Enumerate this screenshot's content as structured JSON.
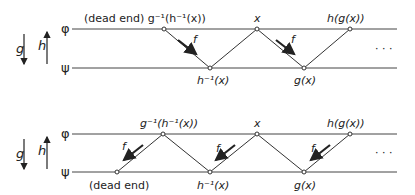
{
  "sets": {
    "top": "φ",
    "bottom": "ψ"
  },
  "maps": {
    "down": "g",
    "up": "h",
    "edge": "f"
  },
  "ellipsis": "· · ·",
  "diagrams": [
    {
      "name": "top-chain",
      "top_labels": {
        "n1": "(dead end) g⁻¹(h⁻¹(x))",
        "n2": "x",
        "n3": "h(g(x))"
      },
      "bottom_labels": {
        "n1": "h⁻¹(x)",
        "n2": "g(x)"
      }
    },
    {
      "name": "bottom-chain",
      "top_labels": {
        "n1": "g⁻¹(h⁻¹(x))",
        "n2": "x",
        "n3": "h(g(x))"
      },
      "bottom_labels": {
        "n0": "(dead end)",
        "n1": "h⁻¹(x)",
        "n2": "g(x)"
      }
    }
  ]
}
